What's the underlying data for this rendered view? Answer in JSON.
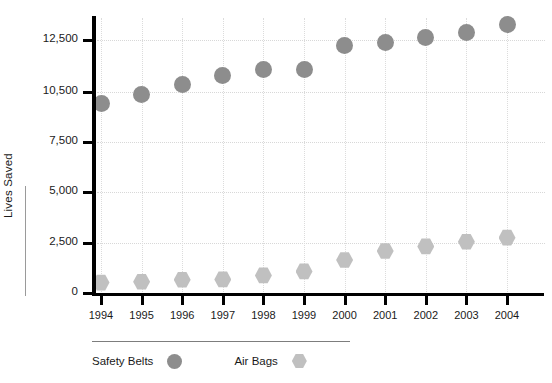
{
  "chart_data": {
    "type": "scatter",
    "title": "",
    "xlabel": "",
    "ylabel": "Lives Saved",
    "categories": [
      "1994",
      "1995",
      "1996",
      "1997",
      "1998",
      "1999",
      "2000",
      "2001",
      "2002",
      "2003",
      "2004"
    ],
    "ytick_labels": [
      "0",
      "2,500",
      "5,000",
      "7,500",
      "10,500",
      "12,500"
    ],
    "ytick_values": [
      0,
      2500,
      5000,
      7500,
      10500,
      12500
    ],
    "ylim": [
      0,
      13200
    ],
    "grid": true,
    "legend_position": "bottom-left",
    "series": [
      {
        "name": "Safety Belts",
        "marker": "circle",
        "color": "#8d8d8d",
        "values": [
          9800,
          10350,
          10800,
          11150,
          11350,
          11350,
          12300,
          12400,
          12600,
          12800,
          13100
        ]
      },
      {
        "name": "Air Bags",
        "marker": "hexagon",
        "color": "#c0c0c0",
        "values": [
          520,
          560,
          660,
          680,
          880,
          1080,
          1650,
          2100,
          2330,
          2560,
          2760
        ]
      }
    ]
  },
  "axis": {
    "y_title": "Lives Saved"
  },
  "legend": {
    "items": [
      {
        "label": "Safety Belts",
        "swatch": "circle-marker-icon"
      },
      {
        "label": "Air Bags",
        "swatch": "hexagon-marker-icon"
      }
    ]
  }
}
